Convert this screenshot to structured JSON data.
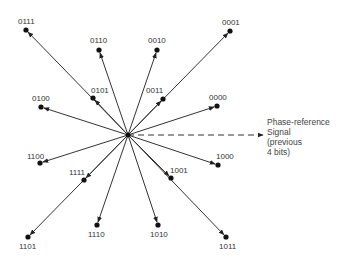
{
  "diagram": {
    "type": "phase-constellation",
    "center": {
      "x": 128,
      "y": 135
    },
    "points": [
      {
        "code": "0111",
        "x": 26,
        "y": 30,
        "lx": 18,
        "ly": 24
      },
      {
        "code": "0110",
        "x": 99,
        "y": 50,
        "lx": 90,
        "ly": 43
      },
      {
        "code": "0010",
        "x": 157,
        "y": 50,
        "lx": 148,
        "ly": 43
      },
      {
        "code": "0001",
        "x": 230,
        "y": 31,
        "lx": 222,
        "ly": 25
      },
      {
        "code": "0101",
        "x": 93,
        "y": 98,
        "lx": 91,
        "ly": 93
      },
      {
        "code": "0011",
        "x": 163,
        "y": 99,
        "lx": 146,
        "ly": 93
      },
      {
        "code": "0100",
        "x": 41,
        "y": 107,
        "lx": 32,
        "ly": 101
      },
      {
        "code": "0000",
        "x": 217,
        "y": 106,
        "lx": 209,
        "ly": 100
      },
      {
        "code": "1100",
        "x": 40,
        "y": 163,
        "lx": 27,
        "ly": 159
      },
      {
        "code": "1111",
        "x": 84,
        "y": 180,
        "lx": 69,
        "ly": 175
      },
      {
        "code": "1001",
        "x": 171,
        "y": 178,
        "lx": 170,
        "ly": 173
      },
      {
        "code": "1000",
        "x": 218,
        "y": 165,
        "lx": 216,
        "ly": 159
      },
      {
        "code": "1101",
        "x": 28,
        "y": 237,
        "lx": 19,
        "ly": 249
      },
      {
        "code": "1110",
        "x": 97,
        "y": 225,
        "lx": 88,
        "ly": 237
      },
      {
        "code": "1010",
        "x": 158,
        "y": 225,
        "lx": 150,
        "ly": 237
      },
      {
        "code": "1011",
        "x": 226,
        "y": 237,
        "lx": 219,
        "ly": 249
      }
    ],
    "reference": {
      "line_end": {
        "x": 263,
        "y": 135
      },
      "label_lines": [
        "Phase-reference",
        "Signal",
        "(previous",
        "4 bits)"
      ]
    },
    "colors": {
      "line": "#333333",
      "dot": "#111111",
      "text": "#444444"
    }
  }
}
